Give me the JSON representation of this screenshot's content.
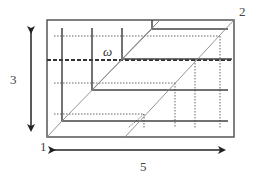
{
  "diagram": {
    "labels": {
      "corner_1": "1",
      "corner_2": "2",
      "height": "3",
      "width": "5",
      "omega": "ω"
    },
    "colors": {
      "line": "#444444",
      "dotted": "#666666",
      "diagonal": "#888888",
      "background": "#ffffff"
    },
    "dimensions": {
      "height_value": "3",
      "width_value": "5"
    }
  }
}
